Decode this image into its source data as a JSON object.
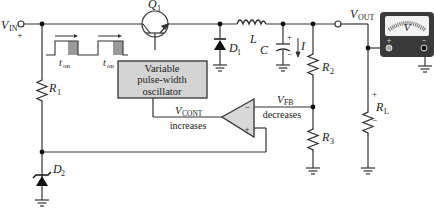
{
  "diagram": {
    "labels": {
      "vin_main": "V",
      "vin_sub": "IN",
      "vin_plus": "+",
      "q1_main": "Q",
      "q1_sub": "1",
      "l": "L",
      "c": "C",
      "i": "I",
      "d1_main": "D",
      "d1_sub": "1",
      "vout_main": "V",
      "vout_sub": "OUT",
      "r1_main": "R",
      "r1_sub": "1",
      "r2_main": "R",
      "r2_sub": "2",
      "r3_main": "R",
      "r3_sub": "3",
      "rl_main": "R",
      "rl_sub": "L",
      "rl_plus": "+",
      "rl_minus": "−",
      "d2_main": "D",
      "d2_sub": "2",
      "ton1_main": "t",
      "ton1_sub": "on",
      "ton2_main": "t",
      "ton2_sub": "on",
      "osc_line1": "Variable",
      "osc_line2": "pulse-width",
      "osc_line3": "oscillator",
      "vcont_main": "V",
      "vcont_sub": "CONT",
      "vcont_note": "increases",
      "vfb_main": "V",
      "vfb_sub": "FB",
      "vfb_note": "decreases",
      "opamp_minus": "−",
      "opamp_plus": "+",
      "cap_plus": "+",
      "cap_minus": "−",
      "meter_v": "V",
      "meter_plus": "+",
      "meter_minus": "−"
    },
    "colors": {
      "wire": "#333333",
      "osc_fill": "#d4d4d4",
      "opamp_fill": "#d8d8d8",
      "pulse_shade": "#9a9a9a",
      "meter_body": "#3a3a3a",
      "meter_face": "#f2f2f2"
    }
  }
}
